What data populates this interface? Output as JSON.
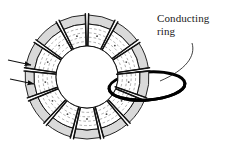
{
  "figure": {
    "background_color": "#ffffff",
    "width": 225,
    "height": 158,
    "annotations": [
      {
        "id": "conducting-ring",
        "line1": "Conducting",
        "line2": "ring",
        "x": 157,
        "y": 12,
        "color": "#1a1a1a",
        "leader": "curved line from label down-left to the thick black ring"
      }
    ],
    "torus": {
      "center_x": 87,
      "center_y": 77,
      "outer_radius_x": 62,
      "outer_radius_y": 62,
      "inner_radius_x": 31,
      "inner_radius_y": 31,
      "segment_count": 13,
      "segment_gap_degrees": 3,
      "outline_color": "#111111",
      "shade_color": "#d9d9d9",
      "face_color": "#ffffff",
      "fieldline_color": "#8a8a8a",
      "fieldline_style": "dashed",
      "fieldlines_per_segment": 4,
      "hole_color": "#ffffff"
    },
    "conducting_ring": {
      "center_x": 147,
      "center_y": 86,
      "radius_x": 38,
      "radius_y": 14,
      "rotation_degrees": -4,
      "stroke_color": "#000000",
      "stroke_width": 3.0
    },
    "arrows": [
      {
        "id": "arrow-upper",
        "x1": 8,
        "y1": 60,
        "x2": 31,
        "y2": 65,
        "color": "#111111"
      },
      {
        "id": "arrow-lower",
        "x1": 10,
        "y1": 79,
        "x2": 34,
        "y2": 84,
        "color": "#111111"
      }
    ],
    "colors": {
      "ink": "#111111",
      "shade": "#d9d9d9",
      "fieldline": "#8a8a8a",
      "ring": "#000000",
      "background": "#ffffff"
    }
  }
}
